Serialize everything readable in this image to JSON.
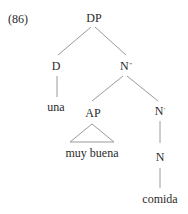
{
  "example_number": "(86)",
  "tree": {
    "root": {
      "label": "DP"
    },
    "d": {
      "label": "D",
      "word": "una"
    },
    "n2": {
      "label": "N",
      "bar": "\""
    },
    "ap": {
      "label": "AP",
      "word": "muy buena"
    },
    "n1": {
      "label": "N",
      "bar": "'"
    },
    "n0": {
      "label": "N",
      "word": "comida"
    }
  },
  "colors": {
    "line": "#9a9a9a",
    "text": "#2a2a2a"
  }
}
